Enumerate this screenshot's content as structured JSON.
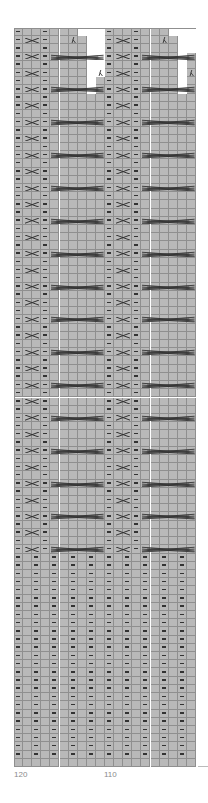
{
  "chart_data": {
    "type": "table",
    "title": "",
    "columns": 20,
    "rows": 90,
    "column_numbers_left_to_right": [
      120,
      119,
      118,
      117,
      116,
      115,
      114,
      113,
      112,
      111,
      110,
      109,
      108,
      107,
      106,
      105,
      104,
      103,
      102,
      101
    ],
    "x_tick_labels": [
      {
        "label": "120",
        "column": 0
      },
      {
        "label": "110",
        "column": 10
      }
    ],
    "legend": {
      "purl": "purl dash (–)",
      "cross2": "2-stitch cross (X)",
      "cable6": "6-stitch cable cross",
      "dec": "decrease (λ)",
      "empty": "no stitch"
    },
    "repeat_width": 10,
    "pattern_rows": 64,
    "rib_rows": 25,
    "blank_bottom_rows": 1,
    "pattern_repeat": {
      "purl_columns": [
        0,
        3
      ],
      "cross2_columns": [
        1,
        2
      ],
      "cable6_columns": [
        4,
        5,
        6,
        7,
        8,
        9
      ],
      "cross2_every_rows": 2,
      "cable6_every_rows": 4
    },
    "rib": {
      "purl_columns": [
        0,
        2,
        4,
        6,
        8,
        10,
        12,
        14,
        16,
        18
      ]
    },
    "top_shaping": {
      "empty_cells": [
        {
          "row": 0,
          "cols": [
            7,
            8,
            9,
            17,
            18,
            19
          ]
        },
        {
          "row": 1,
          "cols": [
            8,
            9,
            18,
            19
          ]
        },
        {
          "row": 2,
          "cols": [
            8,
            9,
            18,
            19
          ]
        },
        {
          "row": 3,
          "cols": [
            8,
            9,
            18
          ]
        },
        {
          "row": 4,
          "cols": [
            8,
            9,
            18
          ]
        },
        {
          "row": 5,
          "cols": [
            8,
            9,
            18
          ]
        },
        {
          "row": 6,
          "cols": [
            8,
            18
          ]
        },
        {
          "row": 7,
          "cols": [
            8,
            18
          ]
        }
      ],
      "decreases": [
        {
          "row": 1,
          "col": 6
        },
        {
          "row": 1,
          "col": 16
        },
        {
          "row": 5,
          "col": 9
        },
        {
          "row": 5,
          "col": 19
        }
      ]
    }
  },
  "colors": {
    "cell": "#b9b9b9",
    "grid": "#8f8f8f",
    "symbol": "#333333",
    "label": "#8a8a8a"
  }
}
